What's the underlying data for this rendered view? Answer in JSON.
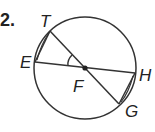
{
  "problem": {
    "number_label": "2."
  },
  "diagram": {
    "type": "circle-geometry",
    "center_label": "F",
    "points": {
      "T": "T",
      "E": "E",
      "H": "H",
      "G": "G",
      "F": "F"
    },
    "segments": [
      "EH",
      "TG",
      "ET",
      "HG"
    ],
    "angle_marked": "EFT",
    "colors": {
      "stroke": "#333333",
      "background": "#ffffff"
    }
  }
}
